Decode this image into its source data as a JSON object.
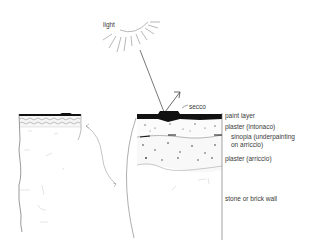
{
  "diagram": {
    "labels": {
      "light": "light",
      "secco": "secco",
      "paint_layer": "paint layer",
      "intonaco": "plaster (intonaco)",
      "sinopia_line1": "sinopia (underpainting",
      "sinopia_line2": "on arriccio)",
      "arriccio": "plaster (arriccio)",
      "wall": "stone or brick wall"
    },
    "colors": {
      "ink": "#2a2a2a",
      "paint": "#111111",
      "light_line": "#555555"
    }
  }
}
